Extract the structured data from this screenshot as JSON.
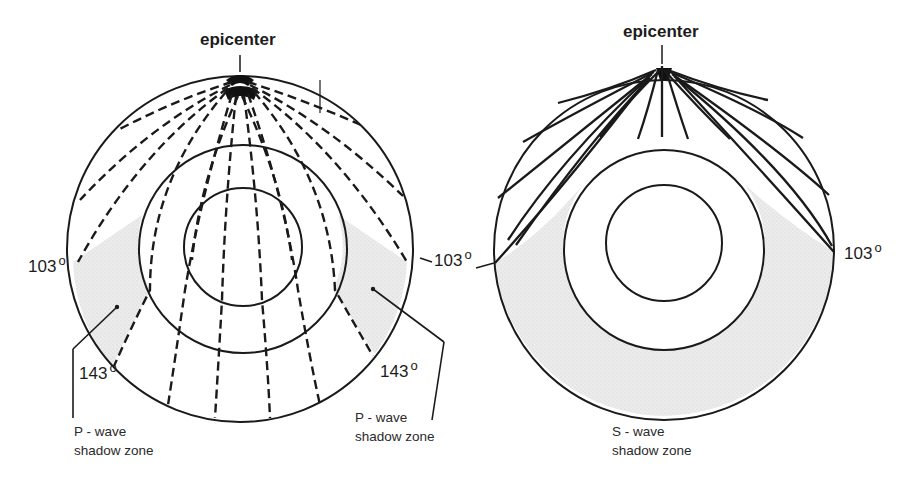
{
  "figure": {
    "panels": [
      {
        "id": "p-wave",
        "epicenter_label": "epicenter",
        "angle_labels": [
          {
            "value": "103",
            "unit": "o",
            "side": "left"
          },
          {
            "value": "103",
            "unit": "o",
            "side": "right"
          },
          {
            "value": "143",
            "unit": "o",
            "side": "left"
          },
          {
            "value": "143",
            "unit": "o",
            "side": "right"
          }
        ],
        "shadow_zone_labels": [
          {
            "line1": "P - wave",
            "line2": "shadow zone",
            "side": "left"
          },
          {
            "line1": "P - wave",
            "line2": "shadow zone",
            "side": "right"
          }
        ],
        "ray_style": "dashed"
      },
      {
        "id": "s-wave",
        "epicenter_label": "epicenter",
        "angle_labels": [
          {
            "value": "103",
            "unit": "o",
            "side": "right"
          }
        ],
        "shadow_zone_labels": [
          {
            "line1": "S - wave",
            "line2": "shadow zone",
            "side": "bottom"
          }
        ],
        "ray_style": "solid"
      }
    ],
    "colors": {
      "line": "#1a1a1a",
      "shadow_fill": "#e6e6e6",
      "background": "#ffffff"
    }
  }
}
